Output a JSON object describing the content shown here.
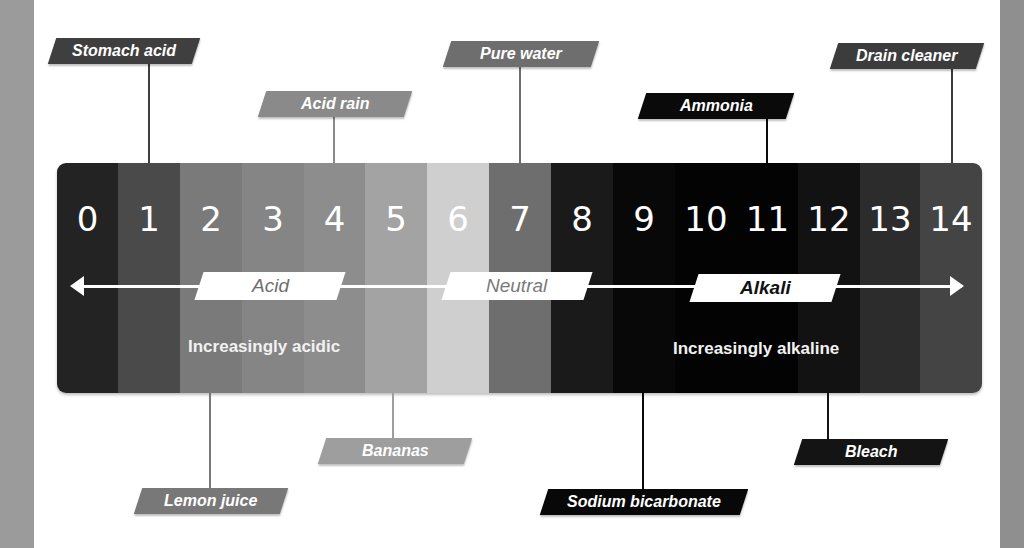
{
  "scale": {
    "bands": [
      {
        "value": "0",
        "color": "#232323",
        "width": 61
      },
      {
        "value": "1",
        "color": "#4a4a4a",
        "width": 62
      },
      {
        "value": "2",
        "color": "#7a7a7a",
        "width": 62
      },
      {
        "value": "3",
        "color": "#858585",
        "width": 62
      },
      {
        "value": "4",
        "color": "#8d8d8d",
        "width": 61
      },
      {
        "value": "5",
        "color": "#a3a3a3",
        "width": 62
      },
      {
        "value": "6",
        "color": "#cfcfcf",
        "width": 62
      },
      {
        "value": "7",
        "color": "#6e6e6e",
        "width": 62
      },
      {
        "value": "8",
        "color": "#1a1a1a",
        "width": 62
      },
      {
        "value": "9",
        "color": "#080808",
        "width": 62
      },
      {
        "value": "10",
        "color": "#030303",
        "width": 62
      },
      {
        "value": "11",
        "color": "#030303",
        "width": 61
      },
      {
        "value": "12",
        "color": "#121212",
        "width": 62
      },
      {
        "value": "13",
        "color": "#2c2c2c",
        "width": 60
      },
      {
        "value": "14",
        "color": "#444444",
        "width": 62
      }
    ],
    "regions": {
      "acid": "Acid",
      "neutral": "Neutral",
      "alkali": "Alkali"
    },
    "descriptions": {
      "acidic": "Increasingly acidic",
      "alkaline": "Increasingly alkaline"
    }
  },
  "examples_top": [
    {
      "label": "Stomach acid",
      "ph": "1",
      "color": "#3f3f3f"
    },
    {
      "label": "Acid rain",
      "ph": "4",
      "color": "#8a8a8a"
    },
    {
      "label": "Pure water",
      "ph": "7",
      "color": "#6e6e6e"
    },
    {
      "label": "Ammonia",
      "ph": "11",
      "color": "#0a0a0a"
    },
    {
      "label": "Drain cleaner",
      "ph": "14",
      "color": "#3c3c3c"
    }
  ],
  "examples_bottom": [
    {
      "label": "Lemon juice",
      "ph": "2",
      "color": "#787878"
    },
    {
      "label": "Bananas",
      "ph": "5",
      "color": "#9e9e9e"
    },
    {
      "label": "Sodium bicarbonate",
      "ph": "9",
      "color": "#080808"
    },
    {
      "label": "Bleach",
      "ph": "12",
      "color": "#141414"
    }
  ]
}
